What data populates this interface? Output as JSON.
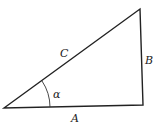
{
  "diagram": {
    "type": "right-triangle",
    "labels": {
      "hypotenuse": "C",
      "vertical_side": "B",
      "horizontal_side": "A",
      "angle": "α"
    },
    "colors": {
      "stroke": "#222222",
      "background": "#ffffff"
    }
  }
}
